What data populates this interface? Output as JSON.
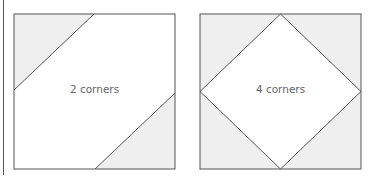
{
  "figure": {
    "panels": [
      {
        "label": "2 corners",
        "corners_shaded": 2
      },
      {
        "label": "4 corners",
        "corners_shaded": 4
      }
    ]
  },
  "colors": {
    "stroke": "#555555",
    "shade": "#efefef",
    "text": "#666666"
  }
}
